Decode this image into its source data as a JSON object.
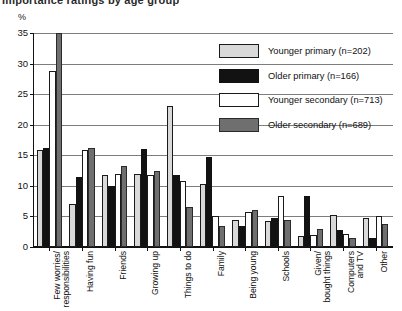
{
  "figure": {
    "title_fragment": "Importance ratings by age group",
    "y_unit": "%"
  },
  "chart_data": {
    "type": "bar",
    "title": "",
    "xlabel": "",
    "ylabel": "%",
    "ylim": [
      0,
      35
    ],
    "yticks": [
      0,
      5,
      10,
      15,
      20,
      25,
      30,
      35
    ],
    "ytick_labels": [
      "0",
      "5",
      "10",
      "15",
      "20",
      "25",
      "30",
      "35"
    ],
    "grid": true,
    "legend_position": "upper right",
    "categories": [
      "Few worries/\nresponsibilities",
      "Having fun",
      "Friends",
      "Growing up",
      "Things to do",
      "Family",
      "Being young",
      "Schools",
      "Given/\nbought things",
      "Computers\nand TV",
      "Other"
    ],
    "series": [
      {
        "name": "Younger primary",
        "n": 202,
        "legend_label": "Younger primary (n=202)",
        "color": "#d9d9d9",
        "values": [
          15.8,
          7.0,
          11.8,
          12.0,
          23.0,
          10.3,
          4.5,
          4.2,
          1.8,
          5.3,
          4.8
        ]
      },
      {
        "name": "Older primary",
        "n": 166,
        "legend_label": "Older primary (n=166)",
        "color": "#121212",
        "values": [
          16.2,
          11.5,
          10.0,
          16.0,
          11.8,
          14.7,
          3.5,
          4.8,
          8.3,
          2.8,
          1.5
        ]
      },
      {
        "name": "Younger secondary",
        "n": 713,
        "legend_label": "Younger secondary (n=713)",
        "color": "#ffffff",
        "values": [
          28.8,
          15.8,
          12.0,
          11.7,
          10.8,
          5.0,
          5.8,
          8.3,
          2.0,
          2.2,
          5.0
        ]
      },
      {
        "name": "Older secondary",
        "n": 689,
        "legend_label": "Older secondary (n=689)",
        "color": "#6f6f6f",
        "values": [
          35.0,
          16.2,
          13.2,
          12.5,
          6.5,
          3.5,
          6.0,
          4.5,
          3.0,
          1.5,
          3.8
        ]
      }
    ]
  },
  "legend": {
    "items": [
      {
        "label": "Younger primary (n=202)",
        "name": "Younger primary",
        "n": "202"
      },
      {
        "label": "Older primary (n=166)",
        "name": "Older primary",
        "n": "166"
      },
      {
        "label": "Younger secondary (n=713)",
        "name": "Younger secondary",
        "n": "713"
      },
      {
        "label": "Older secondary (n=689)",
        "name": "Older secondary",
        "n": "689"
      }
    ]
  }
}
